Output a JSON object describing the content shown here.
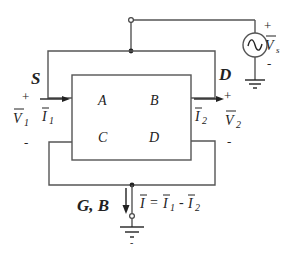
{
  "diagram": {
    "type": "circuit",
    "terminals": {
      "source": "S",
      "drain": "D",
      "gate_bulk": "G, B"
    },
    "regions": [
      "A",
      "B",
      "C",
      "D"
    ],
    "voltage_source": {
      "label": "V",
      "subscript": "s",
      "plus": "+",
      "minus": "-"
    },
    "port1": {
      "voltage_label": "V",
      "voltage_sub": "1",
      "current_label": "I",
      "current_sub": "1",
      "plus": "+",
      "minus": "-"
    },
    "port2": {
      "voltage_label": "V",
      "voltage_sub": "2",
      "current_label": "I",
      "current_sub": "2",
      "plus": "+",
      "minus": "-"
    },
    "ground_current": {
      "lhs": "I",
      "eq": "=",
      "term1": "I",
      "term1_sub": "1",
      "op": "-",
      "term2": "I",
      "term2_sub": "2"
    },
    "ground_minus": "-",
    "colors": {
      "wire": "#555555",
      "text": "#222222",
      "background": "#ffffff"
    }
  }
}
